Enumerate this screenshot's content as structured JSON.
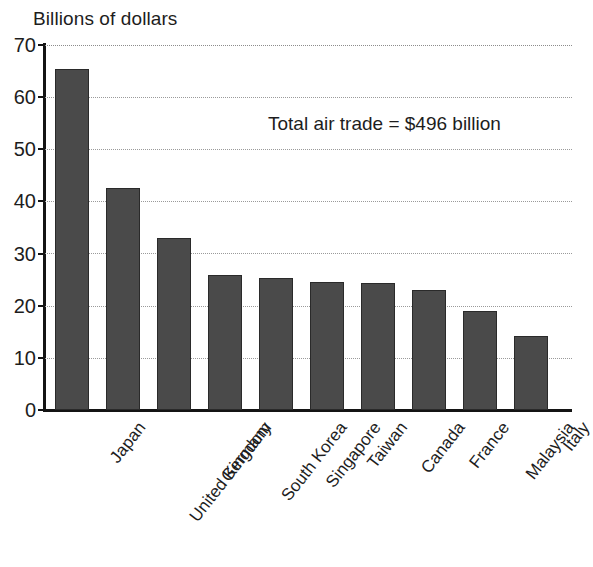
{
  "chart_data": {
    "type": "bar",
    "title": "Billions of dollars",
    "xlabel": "",
    "ylabel": "Billions of dollars",
    "ylim": [
      0,
      70
    ],
    "yticks": [
      0,
      10,
      20,
      30,
      40,
      50,
      60,
      70
    ],
    "grid": true,
    "legend": false,
    "annotation": "Total air trade = $496 billion",
    "bar_color": "#4a4a4a",
    "bar_edge_color": "#2a2a2a",
    "categories": [
      "Japan",
      "United Kingdom",
      "Germany",
      "South Korea",
      "Singapore",
      "Taiwan",
      "Canada",
      "France",
      "Malaysia",
      "Italy"
    ],
    "values": [
      65.4,
      42.5,
      33.0,
      25.8,
      25.4,
      24.5,
      24.3,
      23.0,
      19.0,
      14.2
    ]
  }
}
